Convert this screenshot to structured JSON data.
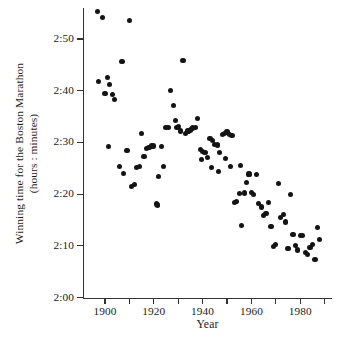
{
  "chart_data": {
    "type": "scatter",
    "title": "",
    "xlabel": "Year",
    "ylabel": "Winning time for the Boston Marathon\n(hours : minutes)",
    "xlim": [
      1891,
      1993
    ],
    "ylim": [
      120,
      176
    ],
    "grid": false,
    "legend": null,
    "x_ticks": [
      1900,
      1920,
      1940,
      1960,
      1980
    ],
    "x_tick_labels": [
      "1900",
      "1920",
      "1940",
      "1960",
      "1980"
    ],
    "x_minor_ticks": [
      1910,
      1930,
      1950,
      1970,
      1990
    ],
    "y_ticks": [
      120,
      130,
      140,
      150,
      160,
      170
    ],
    "y_tick_labels": [
      "2:00",
      "2:10",
      "2:20",
      "2:30",
      "2:40",
      "2:50"
    ],
    "y_unit": "minutes after 2 hours, labelled as hours:minutes",
    "point_color": "#141414",
    "point_count": 92,
    "series": [
      {
        "name": "Boston Marathon winning time",
        "points": [
          {
            "x": 1897,
            "y": 175.4
          },
          {
            "x": 1899,
            "y": 174.2
          },
          {
            "x": 1910,
            "y": 173.6
          },
          {
            "x": 1897.5,
            "y": 161.8
          },
          {
            "x": 1901,
            "y": 162.5
          },
          {
            "x": 1902,
            "y": 161.2
          },
          {
            "x": 1900,
            "y": 159.5
          },
          {
            "x": 1903,
            "y": 159.3
          },
          {
            "x": 1904,
            "y": 158.3
          },
          {
            "x": 1907,
            "y": 165.6
          },
          {
            "x": 1901.5,
            "y": 149.2
          },
          {
            "x": 1909,
            "y": 148.4
          },
          {
            "x": 1906,
            "y": 145.3
          },
          {
            "x": 1907.5,
            "y": 144.0
          },
          {
            "x": 1911,
            "y": 141.5
          },
          {
            "x": 1912,
            "y": 141.8
          },
          {
            "x": 1913,
            "y": 145.1
          },
          {
            "x": 1914,
            "y": 145.3
          },
          {
            "x": 1915,
            "y": 151.7
          },
          {
            "x": 1916,
            "y": 147.2
          },
          {
            "x": 1917,
            "y": 148.8
          },
          {
            "x": 1918,
            "y": 149.0
          },
          {
            "x": 1919,
            "y": 149.3
          },
          {
            "x": 1920,
            "y": 149.3
          },
          {
            "x": 1921,
            "y": 138.1
          },
          {
            "x": 1921.5,
            "y": 137.9
          },
          {
            "x": 1922,
            "y": 143.4
          },
          {
            "x": 1923,
            "y": 149.2
          },
          {
            "x": 1924,
            "y": 145.4
          },
          {
            "x": 1925,
            "y": 152.9
          },
          {
            "x": 1926,
            "y": 152.9
          },
          {
            "x": 1927,
            "y": 160.1
          },
          {
            "x": 1928,
            "y": 157.2
          },
          {
            "x": 1929,
            "y": 154.3
          },
          {
            "x": 1929.5,
            "y": 152.9
          },
          {
            "x": 1930,
            "y": 153.0
          },
          {
            "x": 1931,
            "y": 152.2
          },
          {
            "x": 1932,
            "y": 165.9
          },
          {
            "x": 1933,
            "y": 151.8
          },
          {
            "x": 1934,
            "y": 152.2
          },
          {
            "x": 1935,
            "y": 152.4
          },
          {
            "x": 1936,
            "y": 152.8
          },
          {
            "x": 1937,
            "y": 152.9
          },
          {
            "x": 1938,
            "y": 154.7
          },
          {
            "x": 1939,
            "y": 148.6
          },
          {
            "x": 1940,
            "y": 148.2
          },
          {
            "x": 1941,
            "y": 148.1
          },
          {
            "x": 1942,
            "y": 147.1
          },
          {
            "x": 1939.5,
            "y": 146.7
          },
          {
            "x": 1943,
            "y": 150.7
          },
          {
            "x": 1944,
            "y": 150.4
          },
          {
            "x": 1945,
            "y": 149.6
          },
          {
            "x": 1946,
            "y": 149.5
          },
          {
            "x": 1947,
            "y": 148.1
          },
          {
            "x": 1943.5,
            "y": 145.1
          },
          {
            "x": 1946.5,
            "y": 144.4
          },
          {
            "x": 1948,
            "y": 151.5
          },
          {
            "x": 1949,
            "y": 151.8
          },
          {
            "x": 1950,
            "y": 152.0
          },
          {
            "x": 1951,
            "y": 151.6
          },
          {
            "x": 1952,
            "y": 151.3
          },
          {
            "x": 1949.5,
            "y": 146.9
          },
          {
            "x": 1951.5,
            "y": 145.3
          },
          {
            "x": 1953,
            "y": 138.4
          },
          {
            "x": 1954,
            "y": 138.6
          },
          {
            "x": 1955,
            "y": 140.1
          },
          {
            "x": 1956,
            "y": 134.0
          },
          {
            "x": 1955.5,
            "y": 145.6
          },
          {
            "x": 1957,
            "y": 140.2
          },
          {
            "x": 1958,
            "y": 142.3
          },
          {
            "x": 1959,
            "y": 143.9
          },
          {
            "x": 1960,
            "y": 140.3
          },
          {
            "x": 1961,
            "y": 140.0
          },
          {
            "x": 1962,
            "y": 143.8
          },
          {
            "x": 1963,
            "y": 138.2
          },
          {
            "x": 1964,
            "y": 137.5
          },
          {
            "x": 1965,
            "y": 135.9
          },
          {
            "x": 1966,
            "y": 136.3
          },
          {
            "x": 1967,
            "y": 138.3
          },
          {
            "x": 1968,
            "y": 133.8
          },
          {
            "x": 1969,
            "y": 129.9
          },
          {
            "x": 1970,
            "y": 130.3
          },
          {
            "x": 1971,
            "y": 142.0
          },
          {
            "x": 1972,
            "y": 135.5
          },
          {
            "x": 1973,
            "y": 136.1
          },
          {
            "x": 1974,
            "y": 134.6
          },
          {
            "x": 1975,
            "y": 129.5
          },
          {
            "x": 1976,
            "y": 140.0
          },
          {
            "x": 1977,
            "y": 132.2
          },
          {
            "x": 1978,
            "y": 130.0
          },
          {
            "x": 1979,
            "y": 129.2
          },
          {
            "x": 1980,
            "y": 132.0
          },
          {
            "x": 1981,
            "y": 132.0
          },
          {
            "x": 1982,
            "y": 128.7
          },
          {
            "x": 1983,
            "y": 128.3
          },
          {
            "x": 1984,
            "y": 129.6
          },
          {
            "x": 1985,
            "y": 130.3
          },
          {
            "x": 1986,
            "y": 127.4
          },
          {
            "x": 1987,
            "y": 133.6
          },
          {
            "x": 1988,
            "y": 131.2
          }
        ]
      }
    ]
  },
  "axes": {
    "x_title": "Year",
    "y_title_line1": "Winning time for the Boston Marathon",
    "y_title_line2": "(hours : minutes)"
  }
}
